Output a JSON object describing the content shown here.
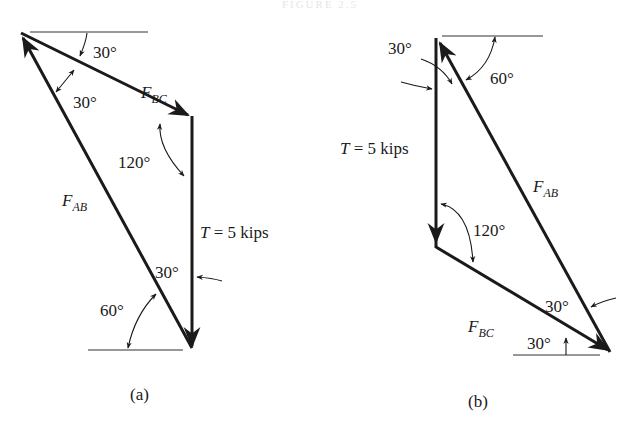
{
  "figure": {
    "title": "FIGURE 2.5",
    "colors": {
      "ink": "#1a1a1a",
      "thin_line": "#333333",
      "background": "#ffffff"
    },
    "panels": [
      {
        "id": "a",
        "caption": "(a)",
        "forces": {
          "fbc": {
            "symbol": "F",
            "subscript": "BC"
          },
          "fab": {
            "symbol": "F",
            "subscript": "AB"
          },
          "tension": {
            "symbol": "T",
            "text": " = 5 kips"
          }
        },
        "angles": {
          "top_horizontal": "30°",
          "between_fab_fbc": "30°",
          "corner_fbc_t": "120°",
          "between_t_fab": "30°",
          "bottom_horizontal": "60°"
        }
      },
      {
        "id": "b",
        "caption": "(b)",
        "forces": {
          "fbc": {
            "symbol": "F",
            "subscript": "BC"
          },
          "fab": {
            "symbol": "F",
            "subscript": "AB"
          },
          "tension": {
            "symbol": "T",
            "text": " = 5 kips"
          }
        },
        "angles": {
          "top_between_t_fab": "30°",
          "top_horizontal": "60°",
          "corner_t_fbc": "120°",
          "between_fbc_fab": "30°",
          "bottom_horizontal": "30°"
        }
      }
    ]
  }
}
